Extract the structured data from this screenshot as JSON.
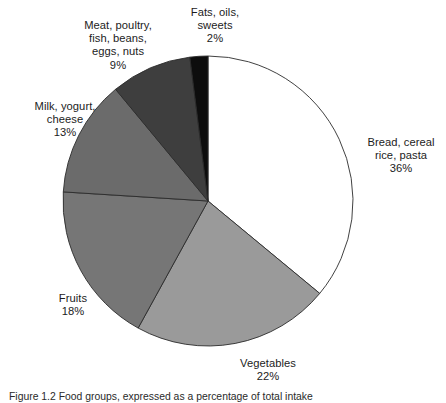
{
  "figure": {
    "caption": "Figure 1.2  Food groups, expressed as a percentage of total intake",
    "background_color": "#ffffff",
    "outline_color": "#2b2b2b"
  },
  "chart_data": {
    "type": "pie",
    "title": "",
    "xlabel": "",
    "ylabel": "",
    "units": "percent",
    "start_angle_deg": 0,
    "direction": "clockwise",
    "legend_position": "outside-labels",
    "grid": false,
    "total": 100,
    "categories": [
      "Bread, cereal rice, pasta",
      "Vegetables",
      "Fruits",
      "Milk, yogurt, cheese",
      "Meat, poultry, fish, beans, eggs, nuts",
      "Fats, oils, sweets"
    ],
    "values": [
      36,
      22,
      18,
      13,
      9,
      2
    ],
    "colors": [
      "#ffffff",
      "#9a9a9a",
      "#767676",
      "#6b6b6b",
      "#3e3e3e",
      "#0d0d0d"
    ],
    "slices": [
      {
        "id": "bread",
        "name": "Bread, cereal rice, pasta",
        "value": 36,
        "value_label": "36%",
        "color": "#ffffff",
        "label_lines": [
          "Bread, cereal",
          "rice, pasta",
          "36%"
        ],
        "label_align": "left"
      },
      {
        "id": "vegetables",
        "name": "Vegetables",
        "value": 22,
        "value_label": "22%",
        "color": "#9a9a9a",
        "label_lines": [
          "Vegetables",
          "22%"
        ],
        "label_align": "center"
      },
      {
        "id": "fruits",
        "name": "Fruits",
        "value": 18,
        "value_label": "18%",
        "color": "#767676",
        "label_lines": [
          "Fruits",
          "18%"
        ],
        "label_align": "center"
      },
      {
        "id": "milk",
        "name": "Milk, yogurt, cheese",
        "value": 13,
        "value_label": "13%",
        "color": "#6b6b6b",
        "label_lines": [
          "Milk, yogurt,",
          "cheese",
          "13%"
        ],
        "label_align": "center"
      },
      {
        "id": "meat",
        "name": "Meat, poultry, fish, beans, eggs, nuts",
        "value": 9,
        "value_label": "9%",
        "color": "#3e3e3e",
        "label_lines": [
          "Meat, poultry,",
          "fish, beans,",
          "eggs, nuts",
          "9%"
        ],
        "label_align": "center"
      },
      {
        "id": "fats",
        "name": "Fats, oils, sweets",
        "value": 2,
        "value_label": "2%",
        "color": "#0d0d0d",
        "label_lines": [
          "Fats, oils,",
          "sweets",
          "2%"
        ],
        "label_align": "center"
      }
    ]
  },
  "geometry": {
    "center_x": 208,
    "center_y": 201,
    "radius": 145
  }
}
